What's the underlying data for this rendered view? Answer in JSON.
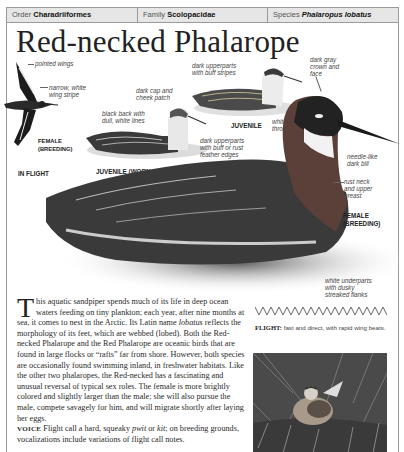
{
  "header": {
    "order_label": "Order",
    "order_value": "Charadriiformes",
    "family_label": "Family",
    "family_value": "Scolopacidae",
    "species_label": "Species",
    "species_value": "Phalaropus lobatus"
  },
  "title": "Red-necked Phalarope",
  "illustrations": {
    "flight": {
      "labels": [
        "pointed wings",
        "narrow, white",
        "wing stripe"
      ],
      "caption_sex": [
        "FEMALE",
        "(BREEDING)"
      ],
      "caption": "IN FLIGHT"
    },
    "juvenile_worn": {
      "labels": [
        "dark cap and",
        "cheek patch",
        "black back with",
        "dull, white lines"
      ],
      "caption": "JUVENILE (WORN PLUMAGE)"
    },
    "juvenile": {
      "labels": [
        "dark upperparts",
        "with buff stripes"
      ],
      "caption": "JUVENILE",
      "throat_label": [
        "white",
        "throat"
      ]
    },
    "female_breeding": {
      "labels_crown": [
        "dark gray",
        "crown and",
        "face"
      ],
      "labels_back": [
        "dark upperparts",
        "with buff or rust",
        "feather edges"
      ],
      "labels_bill": [
        "needle-like",
        "dark bill"
      ],
      "labels_neck": [
        "rust neck",
        "and upper",
        "breast"
      ],
      "labels_under": [
        "white underparts",
        "with dusky",
        "streaked flanks"
      ],
      "caption": [
        "FEMALE",
        "(BREEDING)"
      ]
    }
  },
  "body": {
    "dropcap": "T",
    "paragraph": "his aquatic sandpiper spends much of its life in deep ocean waters feeding on tiny plankton; each year, after nine months at sea, it comes to nest in the Arctic. Its Latin name ",
    "latin": "lobatus",
    "paragraph2": " reflects the morphology of its feet, which are webbed (lobed). Both the Red-necked Phalarope and the Red Phalarope are oceanic birds that are found in large flocks or “rafts” far from shore. However, both species are occasionally found swimming inland, in freshwater habitats. Like the other two phalaropes, the Red-necked has a fascinating and unusual reversal of typical sex roles. The female is more brightly colored and slightly larger than the male; she will also pursue the male, compete savagely for him, and will migrate shortly after laying her eggs.",
    "voice_label": "VOICE",
    "voice_text1": " Flight call a hard, squeaky ",
    "voice_call1": "pwit",
    "voice_or": " or ",
    "voice_call2": "kit",
    "voice_text2": "; on breeding grounds, vocalizations include variations of flight call notes."
  },
  "flight": {
    "label": "FLIGHT:",
    "text": " fast and direct, with rapid wing beats."
  }
}
